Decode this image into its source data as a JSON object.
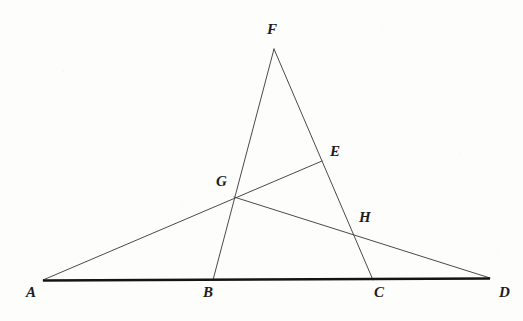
{
  "figure": {
    "kind": "euclidean-geometry-diagram",
    "width": 523,
    "height": 321,
    "background_color": "#fdfdfc",
    "line_color": "#4a4a4a",
    "baseline_color": "#141414",
    "label_color": "#1c1c1c",
    "thin_line_width": 1,
    "baseline_width": 2.6
  },
  "points": {
    "A": {
      "label": "A",
      "x": 43,
      "y": 280,
      "label_x": 26,
      "label_y": 285
    },
    "B": {
      "label": "B",
      "x": 213,
      "y": 280,
      "label_x": 203,
      "label_y": 285
    },
    "C": {
      "label": "C",
      "x": 373,
      "y": 280,
      "label_x": 374,
      "label_y": 285
    },
    "D": {
      "label": "D",
      "x": 490,
      "y": 278,
      "label_x": 499,
      "label_y": 285
    },
    "E": {
      "label": "E",
      "x": 322,
      "y": 161,
      "label_x": 330,
      "label_y": 144
    },
    "F": {
      "label": "F",
      "x": 274,
      "y": 49,
      "label_x": 267,
      "label_y": 22
    },
    "G": {
      "label": "G",
      "x": 234,
      "y": 197,
      "label_x": 216,
      "label_y": 174
    },
    "H": {
      "label": "H",
      "x": 353,
      "y": 236,
      "label_x": 359,
      "label_y": 210
    }
  },
  "segments": [
    {
      "name": "baseline-AD",
      "from": "A",
      "to": "D",
      "style": "thick"
    },
    {
      "name": "line-F-to-B",
      "from": "F",
      "to": "B",
      "style": "thin"
    },
    {
      "name": "line-F-to-C",
      "from": "F",
      "to": "C",
      "style": "thin"
    },
    {
      "name": "line-A-to-E",
      "from": "A",
      "to": "E",
      "style": "thin"
    },
    {
      "name": "line-G-to-D",
      "from": "G",
      "to": "D",
      "style": "thin"
    }
  ],
  "chart_data": {
    "type": "diagram",
    "title": "",
    "vertices": [
      {
        "id": "A",
        "x": 43,
        "y": 280,
        "on_baseline": true
      },
      {
        "id": "B",
        "x": 213,
        "y": 280,
        "on_baseline": true
      },
      {
        "id": "C",
        "x": 373,
        "y": 280,
        "on_baseline": true
      },
      {
        "id": "D",
        "x": 490,
        "y": 278,
        "on_baseline": true
      },
      {
        "id": "E",
        "x": 322,
        "y": 161,
        "on_baseline": false
      },
      {
        "id": "F",
        "x": 274,
        "y": 49,
        "on_baseline": false
      },
      {
        "id": "G",
        "x": 234,
        "y": 197,
        "on_baseline": false
      },
      {
        "id": "H",
        "x": 353,
        "y": 236,
        "on_baseline": false
      }
    ],
    "edges": [
      {
        "from": "A",
        "to": "D",
        "weight": "thick",
        "passes_through": [
          "B",
          "C"
        ]
      },
      {
        "from": "F",
        "to": "B",
        "weight": "thin",
        "passes_through": [
          "G"
        ]
      },
      {
        "from": "F",
        "to": "C",
        "weight": "thin",
        "passes_through": [
          "E",
          "H"
        ]
      },
      {
        "from": "A",
        "to": "E",
        "weight": "thin",
        "passes_through": [
          "G"
        ]
      },
      {
        "from": "G",
        "to": "D",
        "weight": "thin",
        "passes_through": [
          "H"
        ]
      }
    ],
    "intersections": [
      {
        "id": "G",
        "of": [
          "line-F-to-B",
          "line-A-to-E",
          "line-G-to-D"
        ]
      },
      {
        "id": "H",
        "of": [
          "line-F-to-C",
          "line-G-to-D"
        ]
      },
      {
        "id": "E",
        "of": [
          "line-F-to-C",
          "line-A-to-E"
        ]
      }
    ],
    "xlabel": "",
    "ylabel": ""
  }
}
